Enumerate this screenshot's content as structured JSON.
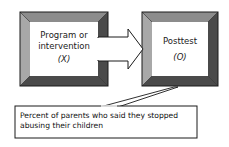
{
  "diagram": {
    "nodes": [
      {
        "id": "x",
        "line1": "Program or",
        "line2": "intervention",
        "symbol": "(X)"
      },
      {
        "id": "o",
        "line1": "Posttest",
        "symbol": "(O)"
      }
    ],
    "edges": [
      {
        "from": "x",
        "to": "o",
        "style": "block-arrow"
      }
    ],
    "callout": {
      "target": "o",
      "line1": "Percent of parents who said they stopped",
      "line2": "abusing their children"
    },
    "colors": {
      "bevel_light": "#a8a8a8",
      "bevel_dark": "#4a4a4a",
      "bevel_top": "#8c8c8c",
      "outline": "#1a1a1a",
      "fill": "#ffffff"
    }
  }
}
